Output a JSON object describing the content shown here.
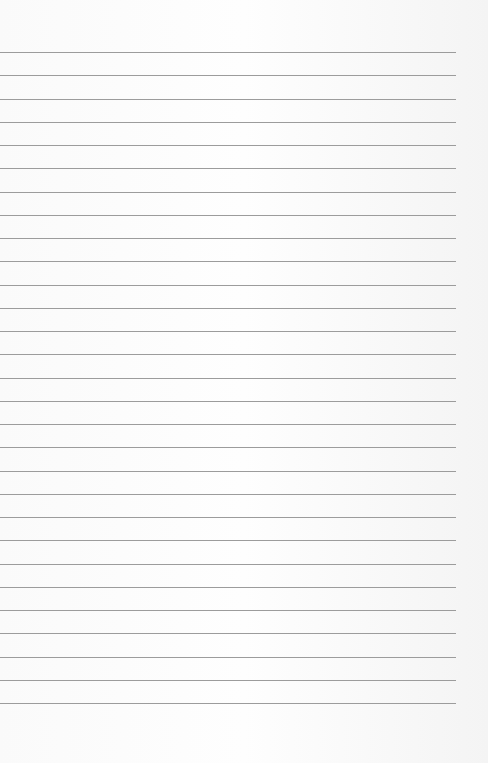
{
  "page": {
    "type": "ruled-paper",
    "line_count": 29,
    "first_line_y": 52,
    "line_spacing": 23.25,
    "line_width": 456,
    "line_color": "#9c9c9c",
    "background_color": "#fbfbfb"
  }
}
